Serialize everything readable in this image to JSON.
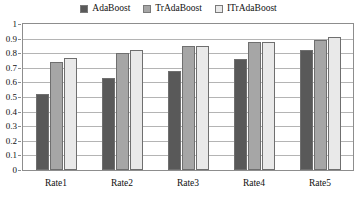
{
  "chart_data": {
    "type": "bar",
    "title": "",
    "xlabel": "",
    "ylabel": "",
    "categories": [
      "Rate1",
      "Rate2",
      "Rate3",
      "Rate4",
      "Rate5"
    ],
    "series": [
      {
        "name": "AdaBoost",
        "color": "#595959",
        "values": [
          0.52,
          0.63,
          0.68,
          0.76,
          0.82
        ]
      },
      {
        "name": "TrAdaBoost",
        "color": "#a6a6a6",
        "values": [
          0.74,
          0.8,
          0.85,
          0.88,
          0.89
        ]
      },
      {
        "name": "ITrAdaBoost",
        "color": "#e9e9e9",
        "values": [
          0.77,
          0.82,
          0.85,
          0.88,
          0.91
        ]
      }
    ],
    "ylim": [
      0,
      1
    ],
    "yticks": [
      0,
      0.1,
      0.2,
      0.3,
      0.4,
      0.5,
      0.6,
      0.7,
      0.8,
      0.9,
      1
    ],
    "ytick_labels": [
      "0",
      "0.1",
      "0.2",
      "0.3",
      "0.4",
      "0.5",
      "0.6",
      "0.7",
      "0.8",
      "0.9",
      "1"
    ],
    "grid": true,
    "legend_position": "top-center"
  }
}
